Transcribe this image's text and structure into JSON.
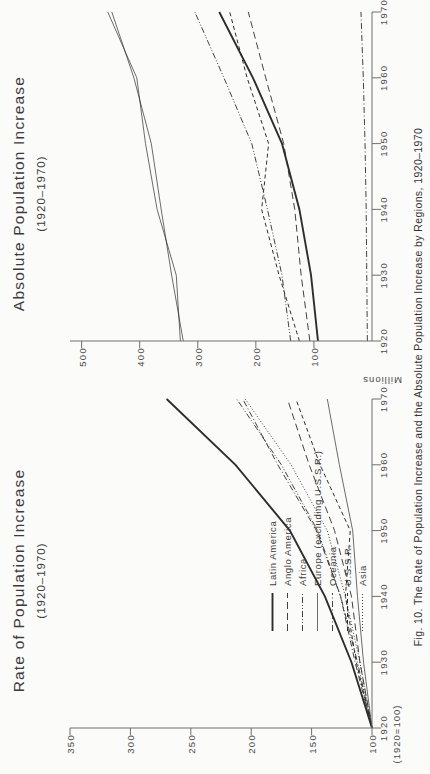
{
  "figure": {
    "caption": "Fig. 10. The Rate of Population Increase and the Absolute Population Increase by Regions, 1920–1970"
  },
  "legend": {
    "items": [
      {
        "label": "Latin America",
        "style": "solid-thick",
        "key": "latin_america"
      },
      {
        "label": "Anglo America",
        "style": "long-dash",
        "key": "anglo_america"
      },
      {
        "label": "Africa",
        "style": "dash-dot-dot",
        "key": "africa"
      },
      {
        "label": "Europe (excluding U.S.S.R.)",
        "style": "solid-thin",
        "key": "europe"
      },
      {
        "label": "Oceania",
        "style": "dash-dot",
        "key": "oceania"
      },
      {
        "label": "U.S.S.R.",
        "style": "dash",
        "key": "ussr"
      },
      {
        "label": "Asia",
        "style": "dotted",
        "key": "asia"
      }
    ]
  },
  "chart_data": [
    {
      "type": "line",
      "panel": "left",
      "title": "Rate of Population Increase",
      "subtitle": "(1920–1970)",
      "xlabel": "",
      "ylabel": "",
      "base_note": "(1920=100)",
      "x": [
        1920,
        1930,
        1940,
        1950,
        1960,
        1970
      ],
      "xlim": [
        1920,
        1970
      ],
      "ylim": [
        100,
        350
      ],
      "xticks": [
        1920,
        1930,
        1940,
        1950,
        1960,
        1970
      ],
      "xtick_labels": [
        "1920",
        "1930",
        "1940",
        "1950",
        "1960",
        "1970"
      ],
      "yticks": [
        100,
        150,
        200,
        250,
        300,
        350
      ],
      "ytick_labels": [
        "100",
        "150",
        "200",
        "250",
        "300",
        "350"
      ],
      "grid": false,
      "legend_position": "inside-left",
      "series": [
        {
          "name": "Latin America",
          "style": "solid-thick",
          "values": [
            100,
            117,
            139,
            168,
            213,
            270
          ]
        },
        {
          "name": "Anglo America",
          "style": "long-dash",
          "values": [
            100,
            110,
            117,
            131,
            152,
            170
          ]
        },
        {
          "name": "Africa",
          "style": "dash-dot-dot",
          "values": [
            100,
            112,
            126,
            145,
            175,
            212
          ]
        },
        {
          "name": "Europe (excluding U.S.S.R.)",
          "style": "solid-thin",
          "values": [
            100,
            107,
            112,
            116,
            127,
            137
          ]
        },
        {
          "name": "Oceania",
          "style": "dash-dot",
          "values": [
            100,
            114,
            126,
            146,
            178,
            207
          ]
        },
        {
          "name": "U.S.S.R.",
          "style": "dash",
          "values": [
            100,
            113,
            122,
            118,
            143,
            163
          ]
        },
        {
          "name": "Asia",
          "style": "dotted",
          "values": [
            100,
            110,
            122,
            137,
            167,
            205
          ]
        }
      ]
    },
    {
      "type": "line",
      "panel": "right",
      "title": "Absolute Population Increase",
      "subtitle": "(1920–1970)",
      "xlabel": "",
      "ylabel": "Millions",
      "x": [
        1920,
        1930,
        1940,
        1950,
        1960,
        1970
      ],
      "xlim": [
        1920,
        1970
      ],
      "ylim": [
        0,
        520
      ],
      "xticks": [
        1920,
        1930,
        1940,
        1950,
        1960,
        1970
      ],
      "xtick_labels": [
        "1920",
        "1930",
        "1940",
        "1950",
        "1960",
        "1970"
      ],
      "yticks": [
        100,
        200,
        300,
        400,
        500
      ],
      "ytick_labels": [
        "100",
        "200",
        "300",
        "400",
        "500"
      ],
      "grid": false,
      "legend_position": "none",
      "series": [
        {
          "name": "Asia",
          "style": "solid-thin",
          "values": [
            330,
            337,
            370,
            390,
            405,
            455
          ]
        },
        {
          "name": "Africa",
          "style": "dash-dot-dot",
          "values": [
            140,
            155,
            180,
            207,
            255,
            305
          ]
        },
        {
          "name": "Latin America",
          "style": "solid-thick",
          "values": [
            93,
            105,
            125,
            155,
            205,
            263
          ]
        },
        {
          "name": "Anglo America",
          "style": "long-dash",
          "values": [
            107,
            122,
            133,
            152,
            183,
            213
          ]
        },
        {
          "name": "U.S.S.R.",
          "style": "dash",
          "values": [
            125,
            160,
            190,
            178,
            215,
            245
          ]
        },
        {
          "name": "Europe (excluding U.S.S.R.)",
          "style": "solid-thin2",
          "values": [
            325,
            345,
            363,
            380,
            410,
            448
          ]
        },
        {
          "name": "Oceania",
          "style": "dash-dot",
          "values": [
            8,
            9,
            10,
            12,
            15,
            19
          ]
        }
      ]
    }
  ]
}
